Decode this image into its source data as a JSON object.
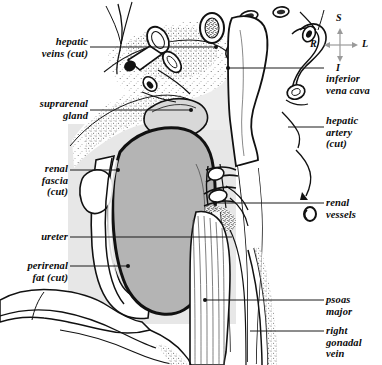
{
  "figure": {
    "background_color": "#ffffff",
    "panel_color": "#e6e6e6",
    "kidney_color": "#b4b4b4",
    "ink_color": "#111111"
  },
  "orientation_compass": {
    "name": "anatomical-orientation-indicator",
    "superior": "S",
    "inferior": "I",
    "right": "R",
    "left": "L"
  },
  "labels": {
    "left": [
      {
        "id": "hepatic-veins-cut",
        "text": "hepatic\nveins (cut)",
        "x": 6,
        "y": 36,
        "width": 82,
        "align": "right"
      },
      {
        "id": "suprarenal-gland",
        "text": "suprarenal\ngland",
        "x": 6,
        "y": 98,
        "width": 82,
        "align": "right"
      },
      {
        "id": "renal-fascia-cut",
        "text": "renal\nfascia\n(cut)",
        "x": 6,
        "y": 163,
        "width": 62,
        "align": "right"
      },
      {
        "id": "ureter",
        "text": "ureter",
        "x": 6,
        "y": 231,
        "width": 62,
        "align": "right"
      },
      {
        "id": "perirenal-fat-cut",
        "text": "perirenal\nfat (cut)",
        "x": 6,
        "y": 260,
        "width": 62,
        "align": "right"
      }
    ],
    "right": [
      {
        "id": "inferior-vena-cava",
        "text": "inferior\nvena cava",
        "x": 326,
        "y": 73,
        "width": 56,
        "align": "left"
      },
      {
        "id": "hepatic-artery-cut",
        "text": "hepatic\nartery\n(cut)",
        "x": 326,
        "y": 115,
        "width": 56,
        "align": "left"
      },
      {
        "id": "renal-vessels",
        "text": "renal\nvessels",
        "x": 326,
        "y": 197,
        "width": 56,
        "align": "left"
      },
      {
        "id": "psoas-major",
        "text": "psoas\nmajor",
        "x": 326,
        "y": 294,
        "width": 56,
        "align": "left"
      },
      {
        "id": "right-gonadal-vein",
        "text": "right\ngonadal\nvein",
        "x": 326,
        "y": 325,
        "width": 56,
        "align": "left"
      }
    ]
  },
  "leader_lines": [
    {
      "id": "leader-hepatic-veins",
      "x1": 90,
      "y1": 47,
      "x2": 216,
      "y2": 47,
      "dot": "end"
    },
    {
      "id": "leader-suprarenal-gland",
      "x1": 90,
      "y1": 110,
      "x2": 191,
      "y2": 110,
      "dot": "end"
    },
    {
      "id": "leader-renal-fascia",
      "x1": 70,
      "y1": 170,
      "x2": 118,
      "y2": 170,
      "dot": "end"
    },
    {
      "id": "leader-ureter",
      "x1": 70,
      "y1": 237,
      "x2": 232,
      "y2": 237,
      "dot": "none"
    },
    {
      "id": "leader-perirenal-fat",
      "x1": 70,
      "y1": 266,
      "x2": 128,
      "y2": 266,
      "dot": "end"
    },
    {
      "id": "leader-inferior-vena-cava",
      "x1": 228,
      "y1": 68,
      "x2": 324,
      "y2": 68,
      "dot": "start"
    },
    {
      "id": "leader-hepatic-artery",
      "x1": 288,
      "y1": 127,
      "x2": 324,
      "y2": 127,
      "dot": "none"
    },
    {
      "id": "leader-renal-vessels",
      "x1": 215,
      "y1": 203,
      "x2": 324,
      "y2": 203,
      "dot": "start"
    },
    {
      "id": "leader-psoas-major",
      "x1": 205,
      "y1": 300,
      "x2": 324,
      "y2": 300,
      "dot": "start"
    },
    {
      "id": "leader-gonadal-vein",
      "x1": 250,
      "y1": 331,
      "x2": 324,
      "y2": 331,
      "dot": "none"
    }
  ],
  "structures": [
    {
      "id": "kidney",
      "label": "right kidney"
    },
    {
      "id": "psoas-major-muscle",
      "label": "psoas major muscle"
    },
    {
      "id": "inferior-vena-cava-vessel",
      "label": "inferior vena cava"
    },
    {
      "id": "suprarenal-gland-organ",
      "label": "suprarenal gland"
    },
    {
      "id": "ureter-tube",
      "label": "ureter"
    },
    {
      "id": "renal-fascia-flap",
      "label": "renal fascia (cut)"
    },
    {
      "id": "perirenal-fat-layer",
      "label": "perirenal fat (cut)"
    },
    {
      "id": "hepatic-vein-stumps",
      "label": "hepatic veins (cut)"
    },
    {
      "id": "hepatic-artery-stump",
      "label": "hepatic artery (cut)"
    },
    {
      "id": "renal-vessel-group",
      "label": "renal vessels"
    },
    {
      "id": "gonadal-vein-vessel",
      "label": "right gonadal vein"
    },
    {
      "id": "diaphragm-crus",
      "label": "diaphragm / crus"
    }
  ]
}
